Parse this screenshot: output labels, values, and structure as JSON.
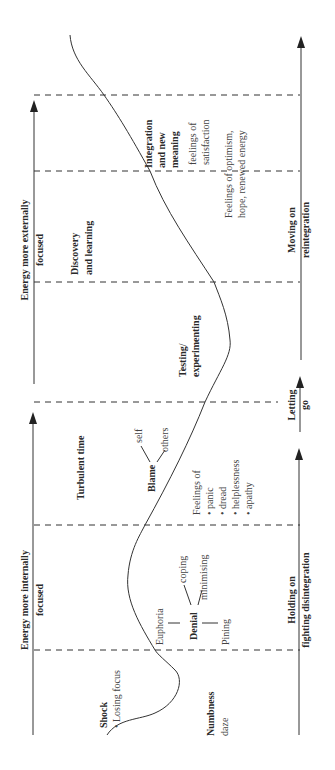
{
  "diagram": {
    "left_axis": {
      "top_label": "Energy more externally focused",
      "top_label_lines": [
        "Energy more externally",
        "focused"
      ],
      "bottom_label_lines": [
        "Energy more internally",
        "focused"
      ]
    },
    "right_axis": {
      "segments": [
        {
          "lines": [
            "Moving on",
            "reintegration"
          ]
        },
        {
          "lines": [
            "Letting",
            "go"
          ]
        },
        {
          "lines": [
            "Holding on",
            "fighting disintegration"
          ]
        }
      ]
    },
    "stages": [
      {
        "name": "Shock",
        "bullets": [
          "Losing focus"
        ]
      },
      {
        "name": "Numbness",
        "sub": "daze"
      },
      {
        "name": "Denial",
        "branches": [
          "Euphoria",
          "coping",
          "minimising",
          "Pining"
        ]
      },
      {
        "name": "Turbulent time"
      },
      {
        "name": "Blame",
        "branches": [
          "self",
          "others"
        ]
      },
      {
        "name": "Feelings of",
        "bullets": [
          "panic",
          "dread",
          "helplessness",
          "apathy"
        ]
      },
      {
        "name": "Testing/ experimenting",
        "lines": [
          "Testing/",
          "experimenting"
        ]
      },
      {
        "name": "Discovery and learning",
        "lines": [
          "Discovery",
          "and learning"
        ]
      },
      {
        "name": "Feelings of optimism, hope, renewed energy",
        "lines": [
          "Feelings of optimism,",
          "hope, renewed energy"
        ]
      },
      {
        "name": "Integration and new meaning",
        "lines": [
          "Integration",
          "and new",
          "meaning"
        ]
      },
      {
        "name": "feelings of satisfaction",
        "lines": [
          "feelings of",
          "satisfaction"
        ]
      }
    ]
  }
}
